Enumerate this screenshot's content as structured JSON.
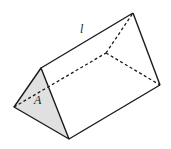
{
  "diagram": {
    "labels": {
      "length": "l",
      "area": "A"
    },
    "colors": {
      "stroke": "#1a1a1a",
      "shaded_face": "#e0e0e0",
      "background": "#ffffff"
    }
  }
}
